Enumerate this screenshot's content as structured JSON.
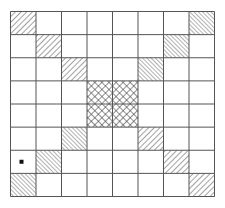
{
  "board": {
    "rows": 8,
    "cols": 8,
    "x": 10,
    "y": 11,
    "width": 204,
    "height": 185,
    "line_color": "#555555",
    "hatch_color": "#444444",
    "cells": [
      {
        "row": 0,
        "col": 0,
        "pattern": "hatch-back"
      },
      {
        "row": 1,
        "col": 1,
        "pattern": "hatch-back"
      },
      {
        "row": 2,
        "col": 2,
        "pattern": "hatch-back"
      },
      {
        "row": 0,
        "col": 7,
        "pattern": "hatch-fwd"
      },
      {
        "row": 1,
        "col": 6,
        "pattern": "hatch-fwd"
      },
      {
        "row": 2,
        "col": 5,
        "pattern": "hatch-fwd"
      },
      {
        "row": 3,
        "col": 3,
        "pattern": "crosshatch"
      },
      {
        "row": 3,
        "col": 4,
        "pattern": "crosshatch"
      },
      {
        "row": 4,
        "col": 3,
        "pattern": "crosshatch"
      },
      {
        "row": 4,
        "col": 4,
        "pattern": "crosshatch"
      },
      {
        "row": 5,
        "col": 2,
        "pattern": "hatch-fwd"
      },
      {
        "row": 6,
        "col": 1,
        "pattern": "hatch-fwd"
      },
      {
        "row": 7,
        "col": 0,
        "pattern": "hatch-fwd"
      },
      {
        "row": 5,
        "col": 5,
        "pattern": "hatch-back"
      },
      {
        "row": 6,
        "col": 6,
        "pattern": "hatch-back"
      },
      {
        "row": 7,
        "col": 7,
        "pattern": "hatch-back"
      }
    ],
    "marker": {
      "row": 6,
      "col": 0,
      "shape": "square",
      "color": "#111111",
      "size": 4
    }
  }
}
